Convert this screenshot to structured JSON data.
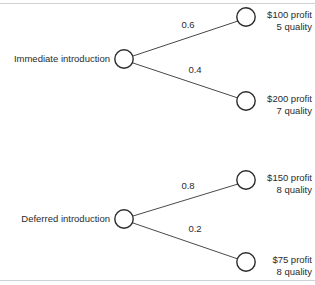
{
  "diagram": {
    "background_color": "#ffffff",
    "line_color": "#4a4a4a",
    "node_stroke_color": "#2b2b2b",
    "text_color": "#2b2b2b",
    "rule_color": "#cfd2d5"
  },
  "trees": [
    {
      "id": "immediate",
      "root_label": "Immediate introduction",
      "branches": [
        {
          "probability": "0.6",
          "outcome_profit": "$100 profit",
          "outcome_quality": "5 quality"
        },
        {
          "probability": "0.4",
          "outcome_profit": "$200 profit",
          "outcome_quality": "7 quality"
        }
      ]
    },
    {
      "id": "deferred",
      "root_label": "Deferred introduction",
      "branches": [
        {
          "probability": "0.8",
          "outcome_profit": "$150 profit",
          "outcome_quality": "8 quality"
        },
        {
          "probability": "0.2",
          "outcome_profit": "$75 profit",
          "outcome_quality": "8 quality"
        }
      ]
    }
  ]
}
